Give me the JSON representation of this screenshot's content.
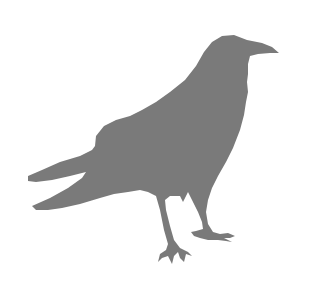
{
  "image": {
    "subject": "crow silhouette",
    "background_color": "#ffffff",
    "silhouette_color": "#7a7a7a"
  }
}
